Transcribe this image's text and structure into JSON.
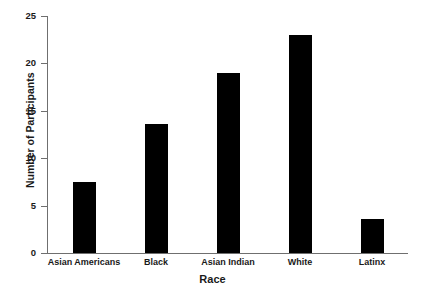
{
  "chart_data": {
    "type": "bar",
    "title": "",
    "subtitle": "",
    "xlabel": "Race",
    "ylabel": "Number of Participants",
    "categories": [
      "Asian Americans",
      "Black",
      "Asian Indian",
      "White",
      "Latinx"
    ],
    "values": [
      7.5,
      13.6,
      19,
      23,
      3.6
    ],
    "series": [
      {
        "name": "Number of Participants",
        "values": [
          7.5,
          13.6,
          19,
          23,
          3.6
        ]
      }
    ],
    "ylim": [
      0,
      25
    ],
    "yticks": [
      0,
      5,
      10,
      15,
      20,
      25
    ],
    "ytick_labels": [
      "0",
      "5",
      "10",
      "15",
      "20",
      "25"
    ],
    "grid": false,
    "legend": "none",
    "bar_color": "#000000",
    "axis_color": "#6f6f6f",
    "text_color": "#1a1a1a",
    "background": "#ffffff"
  }
}
